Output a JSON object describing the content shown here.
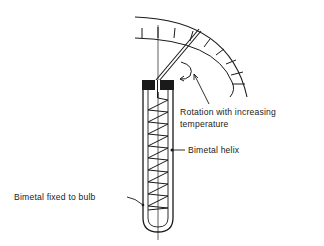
{
  "diagram": {
    "labels": {
      "rotation_line1": "Rotation with increasing",
      "rotation_line2": "temperature",
      "helix": "Bimetal helix",
      "fixed": "Bimetal fixed to bulb"
    },
    "colors": {
      "ink": "#1a1a1a",
      "background": "#ffffff"
    }
  }
}
